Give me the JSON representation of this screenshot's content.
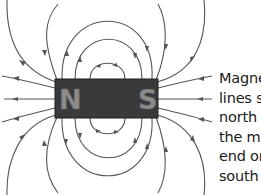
{
  "diagram": {
    "magnet": {
      "north_label": "N",
      "south_label": "S",
      "color": "#3a3a3a",
      "label_color": "#8c8c8c"
    },
    "field_line_color": "#555555",
    "caption_lines": [
      "Magnet",
      "lines sta",
      "north po",
      "the mag",
      "end on t",
      "south p"
    ]
  }
}
